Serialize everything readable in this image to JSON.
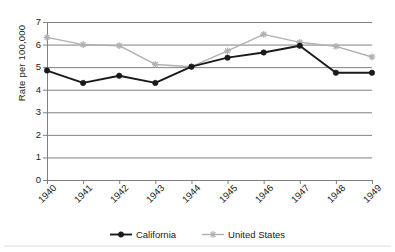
{
  "chart_data": {
    "type": "line",
    "title": "",
    "subtitle": "",
    "xlabel": "",
    "ylabel": "Rate per 100,000",
    "categories": [
      "1940",
      "1941",
      "1942",
      "1943",
      "1944",
      "1945",
      "1946",
      "1947",
      "1948",
      "1949"
    ],
    "x": [
      1940,
      1941,
      1942,
      1943,
      1944,
      1945,
      1946,
      1947,
      1948,
      1949
    ],
    "ylim": [
      0,
      7
    ],
    "xlim": [
      1940,
      1949
    ],
    "y_ticks": [
      0,
      1,
      2,
      3,
      4,
      5,
      6,
      7
    ],
    "y_tick_labels": [
      "0",
      "1",
      "2",
      "3",
      "4",
      "5",
      "6",
      "7"
    ],
    "grid": "horizontal",
    "legend_position": "bottom-center",
    "series": [
      {
        "name": "California",
        "color": "#1a1a1a",
        "marker": "circle",
        "values": [
          4.85,
          4.3,
          4.62,
          4.3,
          5.02,
          5.42,
          5.65,
          5.95,
          4.75,
          4.75
        ]
      },
      {
        "name": "United States",
        "color": "#b0b0b0",
        "marker": "star",
        "values": [
          6.32,
          6.0,
          5.95,
          5.12,
          5.02,
          5.72,
          6.45,
          6.1,
          5.92,
          5.45
        ]
      }
    ],
    "annotations": []
  },
  "axes": {
    "y_title": "Rate per 100,000"
  },
  "legend": {
    "entries": [
      {
        "label": "California"
      },
      {
        "label": "United States"
      }
    ]
  },
  "style": {
    "background": "#ffffff",
    "gridline_color": "#808080",
    "axis_color": "#808080",
    "california_color": "#1a1a1a",
    "united_states_color": "#b0b0b0"
  }
}
